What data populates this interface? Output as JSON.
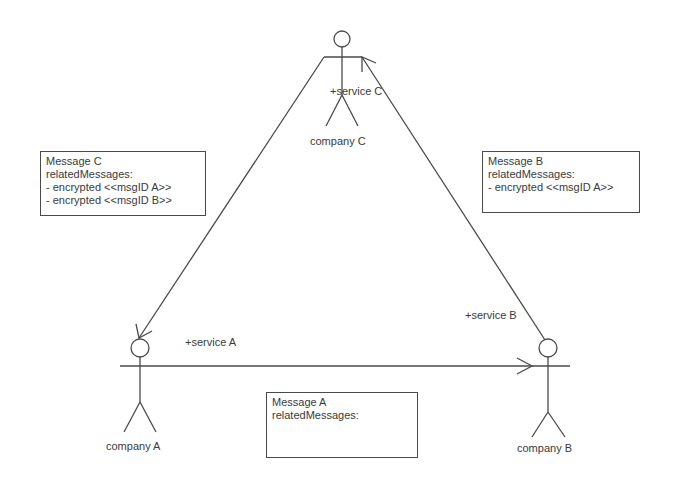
{
  "actors": {
    "company_a": {
      "name": "company A",
      "role": "+service A"
    },
    "company_b": {
      "name": "company B",
      "role": "+service B"
    },
    "company_c": {
      "name": "company C",
      "role": "+service C"
    }
  },
  "notes": {
    "message_c": {
      "title": "Message C",
      "subtitle": "relatedMessages:",
      "items": [
        "- encrypted <<msgID A>>",
        "- encrypted <<msgID B>>"
      ]
    },
    "message_b": {
      "title": "Message B",
      "subtitle": "relatedMessages:",
      "items": [
        "- encrypted <<msgID A>>"
      ]
    },
    "message_a": {
      "title": "Message A",
      "subtitle": "relatedMessages:",
      "items": []
    }
  },
  "associations": [
    {
      "from": "company C",
      "to": "company A",
      "directed": true
    },
    {
      "from": "company A",
      "to": "company B",
      "directed": true
    },
    {
      "from": "company B",
      "to": "company C",
      "directed": true
    }
  ],
  "colors": {
    "stroke": "#4a4a4a",
    "text": "#3a3a3a",
    "background": "#ffffff"
  }
}
